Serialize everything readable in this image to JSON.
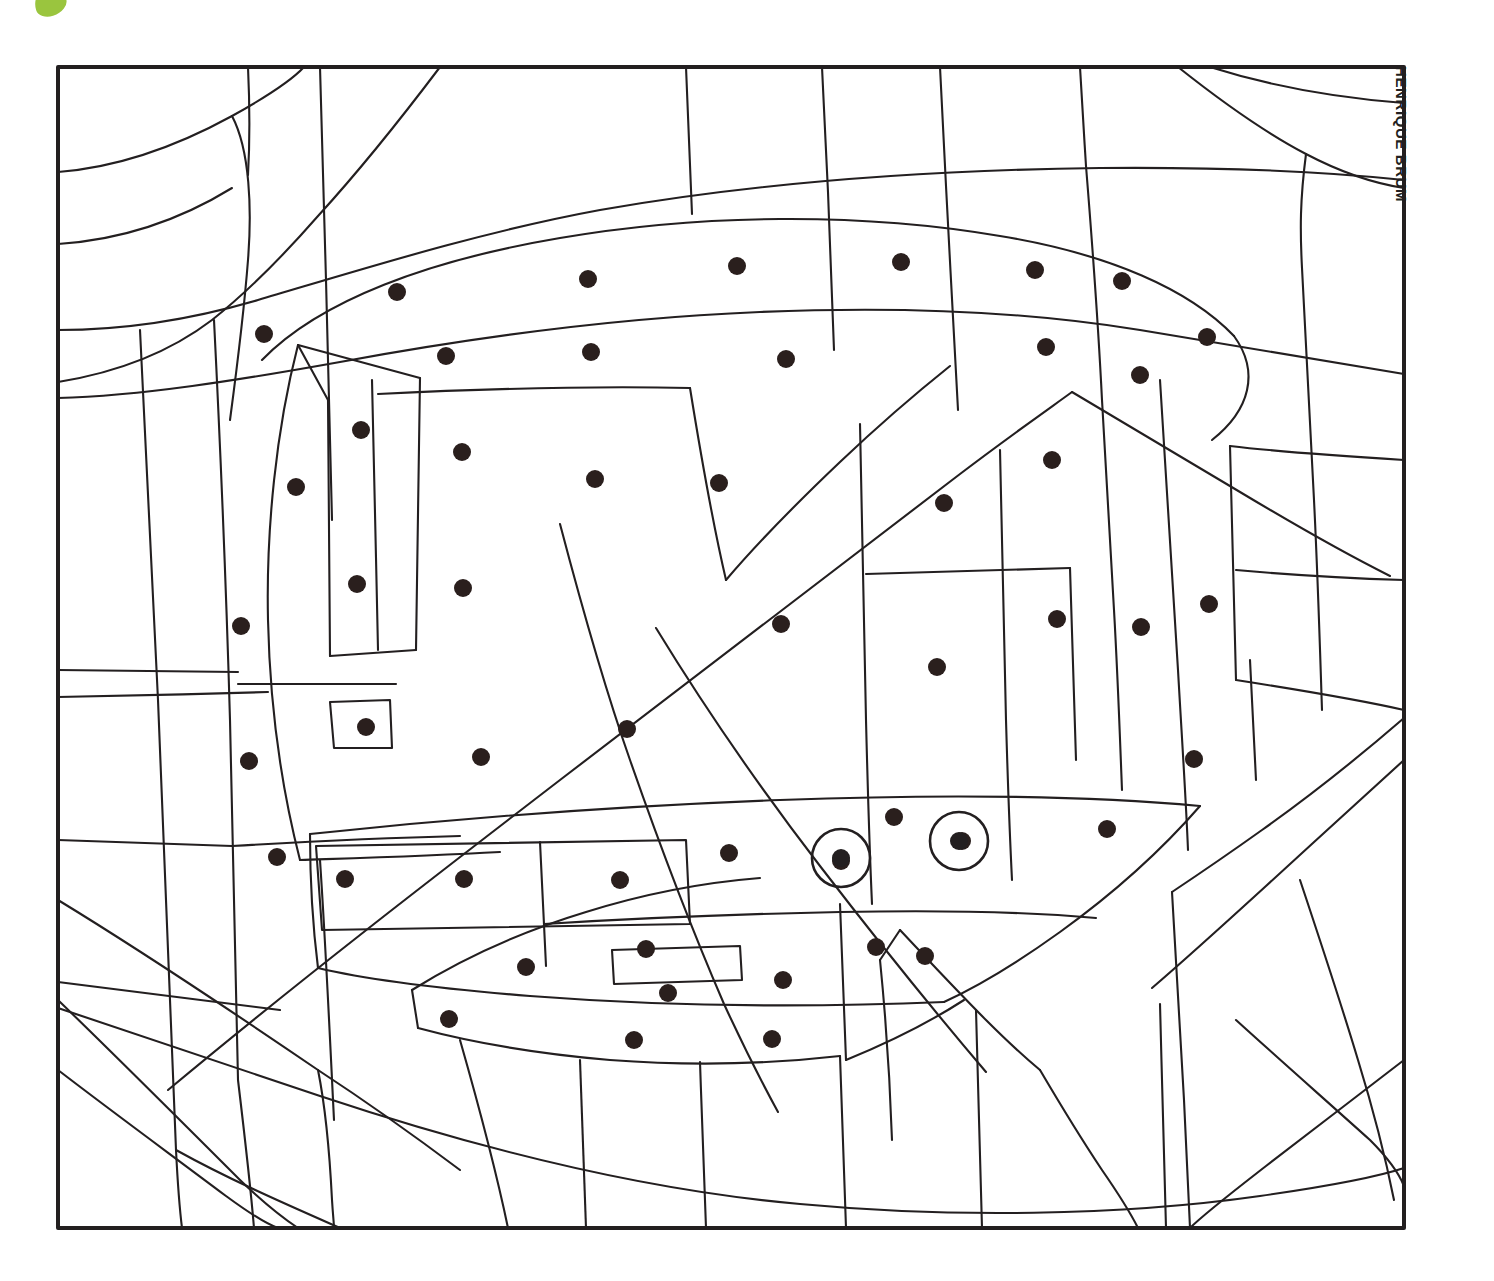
{
  "page": {
    "kind": "color-by-dots coloring page",
    "background_color": "#ffffff",
    "ink_color": "#231f20",
    "dot_color": "#2a1f1d"
  },
  "logo": {
    "name": "leaf-logo",
    "color": "#9ac53e"
  },
  "credit": {
    "text": "HENRIQUE BRUM"
  },
  "frame": {
    "x": 58,
    "y": 67,
    "width": 1346,
    "height": 1161,
    "stroke_width": 4
  },
  "chart_data": {
    "type": "scatter",
    "title": "",
    "xlabel": "",
    "ylabel": "",
    "xlim": [
      58,
      1404
    ],
    "ylim": [
      67,
      1228
    ],
    "grid": false,
    "legend": null,
    "series": [
      {
        "name": "marked-regions-dots",
        "marker": "filled-circle",
        "radius": 9,
        "color": "#2a1f1d",
        "points": [
          [
            397,
            292
          ],
          [
            588,
            279
          ],
          [
            737,
            266
          ],
          [
            901,
            262
          ],
          [
            1035,
            270
          ],
          [
            1122,
            281
          ],
          [
            264,
            334
          ],
          [
            446,
            356
          ],
          [
            591,
            352
          ],
          [
            786,
            359
          ],
          [
            1046,
            347
          ],
          [
            1207,
            337
          ],
          [
            361,
            430
          ],
          [
            462,
            452
          ],
          [
            595,
            479
          ],
          [
            719,
            483
          ],
          [
            944,
            503
          ],
          [
            1140,
            375
          ],
          [
            1052,
            460
          ],
          [
            296,
            487
          ],
          [
            357,
            584
          ],
          [
            463,
            588
          ],
          [
            241,
            626
          ],
          [
            781,
            624
          ],
          [
            1057,
            619
          ],
          [
            1141,
            627
          ],
          [
            1209,
            604
          ],
          [
            937,
            667
          ],
          [
            627,
            729
          ],
          [
            249,
            761
          ],
          [
            481,
            757
          ],
          [
            1194,
            759
          ],
          [
            366,
            727
          ],
          [
            894,
            817
          ],
          [
            1107,
            829
          ],
          [
            277,
            857
          ],
          [
            345,
            879
          ],
          [
            464,
            879
          ],
          [
            620,
            880
          ],
          [
            729,
            853
          ],
          [
            841,
            861
          ],
          [
            962,
            841
          ],
          [
            876,
            947
          ],
          [
            925,
            956
          ],
          [
            646,
            949
          ],
          [
            526,
            967
          ],
          [
            783,
            980
          ],
          [
            668,
            993
          ],
          [
            449,
            1019
          ],
          [
            634,
            1040
          ],
          [
            772,
            1039
          ]
        ]
      },
      {
        "name": "eye-circles",
        "marker": "ring-with-center-dot",
        "outer_radius": 29,
        "inner_radius": 9,
        "color": "#231f20",
        "points": [
          [
            841,
            858
          ],
          [
            959,
            841
          ]
        ]
      }
    ]
  },
  "regions": {
    "count_dots": 51,
    "count_eye_circles": 2
  }
}
